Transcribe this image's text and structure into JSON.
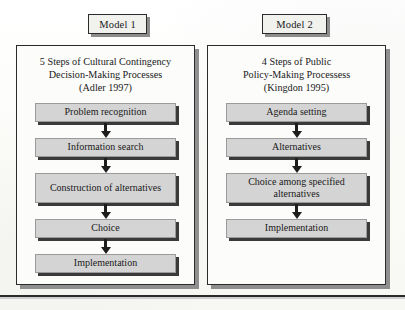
{
  "figure": {
    "tabs": [
      {
        "label": "Model 1"
      },
      {
        "label": "Model 2"
      }
    ],
    "panels": [
      {
        "heading_lines": [
          "5 Steps of Cultural Contingency",
          "Decision-Making Processes",
          "(Adler 1997)"
        ],
        "steps": [
          {
            "label": "Problem recognition"
          },
          {
            "label": "Information search"
          },
          {
            "label": "Construction of alternatives"
          },
          {
            "label": "Choice"
          },
          {
            "label": "Implementation"
          }
        ]
      },
      {
        "heading_lines": [
          "4 Steps of Public",
          "Policy-Making Processess",
          "(Kingdon 1995)"
        ],
        "steps": [
          {
            "label": "Agenda setting"
          },
          {
            "label": "Alternatives"
          },
          {
            "label": "Choice among specified alternatives"
          },
          {
            "label": "Implementation"
          }
        ]
      }
    ],
    "colors": {
      "step_fill": "#d4d4d4",
      "step_shadow": "#3a3a3a",
      "panel_border": "#2b2b2b",
      "panel_shadow": "#8f8f8f",
      "arrow": "#1d1d1d",
      "page_background": "#fdfdfb"
    }
  }
}
